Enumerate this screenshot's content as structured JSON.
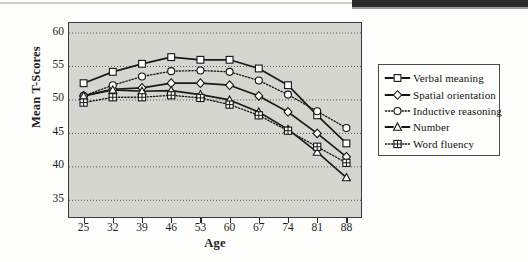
{
  "figure": {
    "y_axis_title": "Mean T-Scores",
    "x_axis_title": "Age"
  },
  "legend": {
    "items": [
      {
        "label": "Verbal meaning",
        "marker": "open-square",
        "line": "solid"
      },
      {
        "label": "Spatial orientation",
        "marker": "open-diamond",
        "line": "solid"
      },
      {
        "label": "Inductive reasoning",
        "marker": "open-circle",
        "line": "dotted"
      },
      {
        "label": "Number",
        "marker": "open-triangle",
        "line": "solid"
      },
      {
        "label": "Word fluency",
        "marker": "crossed-square",
        "line": "dotted"
      }
    ]
  },
  "chart_data": {
    "type": "line",
    "title": "",
    "xlabel": "Age",
    "ylabel": "Mean T-Scores",
    "x": [
      25,
      32,
      39,
      46,
      53,
      60,
      67,
      74,
      81,
      88
    ],
    "xticklabels": [
      "25",
      "32",
      "39",
      "46",
      "53",
      "60",
      "67",
      "74",
      "81",
      "88"
    ],
    "yticklabels": [
      "35",
      "40",
      "45",
      "50",
      "55",
      "60"
    ],
    "yticks": [
      35,
      40,
      45,
      50,
      55,
      60
    ],
    "xlim": [
      21.5,
      91.5
    ],
    "ylim": [
      32.5,
      61.5
    ],
    "grid": "horizontal-dotted",
    "legend_position": "right-outside",
    "series": [
      {
        "name": "Verbal meaning",
        "marker": "open-square",
        "line": "solid",
        "color": "#1a1a1a",
        "values": [
          52.5,
          54.2,
          55.4,
          56.4,
          56.0,
          56.0,
          54.7,
          52.2,
          47.7,
          43.5
        ]
      },
      {
        "name": "Spatial orientation",
        "marker": "open-diamond",
        "line": "solid",
        "color": "#1a1a1a",
        "values": [
          50.6,
          51.6,
          51.8,
          52.5,
          52.5,
          52.2,
          50.6,
          48.2,
          45.0,
          41.5
        ]
      },
      {
        "name": "Inductive reasoning",
        "marker": "open-circle",
        "line": "dotted",
        "color": "#1a1a1a",
        "values": [
          50.6,
          52.2,
          53.5,
          54.3,
          54.4,
          54.2,
          52.9,
          50.8,
          48.3,
          45.8
        ]
      },
      {
        "name": "Number",
        "marker": "open-triangle",
        "line": "solid",
        "color": "#1a1a1a",
        "values": [
          50.6,
          51.5,
          51.3,
          51.4,
          50.8,
          50.0,
          48.2,
          45.6,
          42.2,
          38.4
        ]
      },
      {
        "name": "Word fluency",
        "marker": "crossed-square",
        "line": "dotted",
        "color": "#1a1a1a",
        "values": [
          49.6,
          50.4,
          50.4,
          50.7,
          50.3,
          49.3,
          47.7,
          45.4,
          43.0,
          40.6
        ]
      }
    ]
  }
}
